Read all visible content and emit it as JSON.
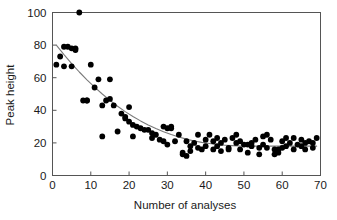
{
  "figure": {
    "background_color": "#ffffff",
    "top_cropped_text": "",
    "marker_color": "#000000",
    "curve_color": "#7a7a7a",
    "axis_color": "#555555"
  },
  "chart_data": {
    "type": "scatter",
    "title": "",
    "xlabel": "Number of analyses",
    "ylabel": "Peak height",
    "xlim": [
      0,
      70
    ],
    "ylim": [
      0,
      100
    ],
    "xticks": [
      0,
      10,
      20,
      30,
      40,
      50,
      60,
      70
    ],
    "yticks": [
      0,
      20,
      40,
      60,
      80,
      100
    ],
    "grid": false,
    "legend": null,
    "x": [
      1,
      2,
      3,
      3,
      4,
      5,
      5,
      6,
      6,
      7,
      8,
      9,
      9,
      10,
      11,
      12,
      13,
      13,
      14,
      15,
      15,
      16,
      17,
      18,
      19,
      19,
      20,
      20,
      21,
      21,
      22,
      23,
      24,
      25,
      26,
      26,
      27,
      28,
      29,
      29,
      30,
      30,
      31,
      31,
      32,
      33,
      34,
      34,
      35,
      35,
      36,
      36,
      37,
      38,
      38,
      39,
      40,
      40,
      41,
      42,
      42,
      43,
      43,
      44,
      44,
      45,
      46,
      46,
      47,
      48,
      48,
      49,
      49,
      50,
      51,
      51,
      52,
      52,
      53,
      54,
      54,
      55,
      55,
      56,
      56,
      57,
      58,
      58,
      59,
      59,
      60,
      60,
      61,
      61,
      62,
      63,
      63,
      64,
      65,
      65,
      66,
      66,
      67,
      68,
      68,
      69
    ],
    "y": [
      68,
      73,
      79,
      67,
      79,
      78,
      67,
      78,
      77,
      100,
      46,
      46,
      46,
      68,
      54,
      59,
      24,
      43,
      46,
      59,
      47,
      43,
      27,
      38,
      36,
      35,
      42,
      33,
      24,
      31,
      30,
      29,
      28,
      28,
      26,
      23,
      25,
      22,
      21,
      30,
      29,
      19,
      29,
      30,
      21,
      25,
      14,
      13,
      21,
      12,
      18,
      15,
      20,
      25,
      17,
      16,
      22,
      18,
      25,
      21,
      16,
      23,
      18,
      20,
      15,
      22,
      17,
      16,
      23,
      25,
      20,
      21,
      16,
      19,
      19,
      14,
      20,
      18,
      22,
      17,
      13,
      24,
      19,
      25,
      17,
      22,
      13,
      16,
      16,
      14,
      21,
      17,
      23,
      18,
      20,
      23,
      16,
      19,
      22,
      18,
      20,
      16,
      21,
      20,
      17,
      23
    ],
    "fit_curve": {
      "label": "",
      "model": "exponential decay to plateau",
      "x": [
        1,
        3,
        5,
        7,
        9,
        11,
        13,
        15,
        17,
        19,
        21,
        23,
        25,
        27,
        29,
        31,
        33,
        35,
        37,
        39,
        41,
        43,
        45,
        47,
        49,
        51,
        53,
        55,
        57,
        59,
        61,
        63,
        65,
        67,
        69
      ],
      "y": [
        80.0,
        74.2,
        68.7,
        63.5,
        58.7,
        54.2,
        50.0,
        46.1,
        42.5,
        39.2,
        36.2,
        33.5,
        31.0,
        28.8,
        26.8,
        25.1,
        23.6,
        22.3,
        21.2,
        20.3,
        19.6,
        19.0,
        18.6,
        18.3,
        18.1,
        18.0,
        18.0,
        18.0,
        18.0,
        18.0,
        18.0,
        18.0,
        18.0,
        18.0,
        18.0
      ]
    }
  }
}
